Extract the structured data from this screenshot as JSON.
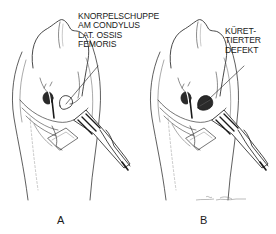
{
  "figure": {
    "panels": [
      {
        "id": "A",
        "letter": "A",
        "annotation": {
          "lines": [
            "KNORPELSCHUPPE",
            "AM CONDYLUS",
            "LAT. OSSIS",
            "FEMORIS"
          ]
        }
      },
      {
        "id": "B",
        "letter": "B",
        "annotation": {
          "lines": [
            "KÜRET-",
            "TIERTER",
            "DEFEKT"
          ]
        }
      }
    ],
    "colors": {
      "ink": "#1a1a1a",
      "background": "#ffffff",
      "shade": "#555555"
    }
  }
}
